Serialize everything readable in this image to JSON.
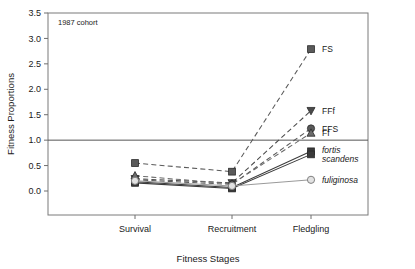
{
  "chart_data": {
    "type": "line",
    "title": "",
    "annotation": "1987 cohort",
    "xlabel": "Fitness Stages",
    "ylabel": "Fitness Proportions",
    "categories": [
      "Survival",
      "Recruitment",
      "Fledgling"
    ],
    "ylim": [
      0.0,
      3.5
    ],
    "yticks": [
      "0.0",
      "0.5",
      "1.0",
      "1.5",
      "2.0",
      "2.5",
      "3.0",
      "3.5"
    ],
    "ytick_values": [
      0.0,
      0.5,
      1.0,
      1.5,
      2.0,
      2.5,
      3.0,
      3.5
    ],
    "grid": false,
    "reference_line": 1.0,
    "legend_position": "right-inline",
    "series": [
      {
        "name": "FS",
        "label": "FS",
        "marker": "square",
        "italic": false,
        "dashed": true,
        "color": "#5a5a5a",
        "values": [
          0.55,
          0.38,
          2.79
        ]
      },
      {
        "name": "FFf",
        "label": "FFf",
        "marker": "triangle-down",
        "italic": false,
        "dashed": true,
        "color": "#4a4a4a",
        "values": [
          0.24,
          0.16,
          1.58
        ]
      },
      {
        "name": "FFS",
        "label": "FFS",
        "marker": "circle",
        "italic": false,
        "dashed": true,
        "color": "#5a5a5a",
        "values": [
          0.22,
          0.13,
          1.23
        ]
      },
      {
        "name": "Ff",
        "label": "Ff",
        "marker": "triangle-up",
        "italic": false,
        "dashed": true,
        "color": "#6a6a6a",
        "values": [
          0.3,
          0.14,
          1.14
        ]
      },
      {
        "name": "fortis",
        "label": "fortis",
        "marker": "square",
        "italic": true,
        "dashed": false,
        "color": "#3a3a3a",
        "values": [
          0.18,
          0.07,
          0.78
        ]
      },
      {
        "name": "scandens",
        "label": "scandens",
        "marker": "square",
        "italic": true,
        "dashed": false,
        "color": "#3a3a3a",
        "values": [
          0.16,
          0.05,
          0.72
        ]
      },
      {
        "name": "fuliginosa",
        "label": "fuliginosa",
        "marker": "circle-open",
        "italic": true,
        "dashed": false,
        "color": "#9a9a9a",
        "values": [
          0.2,
          0.1,
          0.22
        ]
      }
    ]
  }
}
